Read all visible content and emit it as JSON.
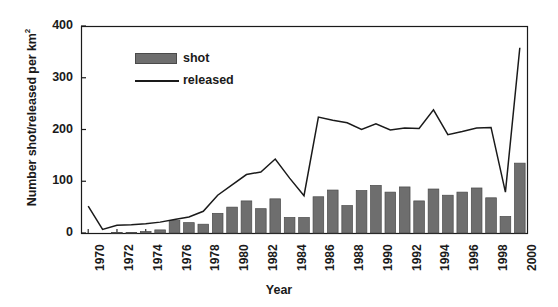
{
  "chart_data": {
    "type": "bar",
    "title": "",
    "xlabel": "Year",
    "ylabel": "Number shot/released per km²",
    "ylabel_text": "Number shot/released per km",
    "ylabel_sup": "2",
    "ylim": [
      0,
      400
    ],
    "yticks": [
      0,
      100,
      200,
      300,
      400
    ],
    "xlim": [
      1970,
      2000
    ],
    "xticks": [
      1970,
      1972,
      1974,
      1976,
      1978,
      1980,
      1982,
      1984,
      1986,
      1988,
      1990,
      1992,
      1994,
      1996,
      1998,
      2000
    ],
    "grid": false,
    "legend_position": "top-left-inside",
    "categories": [
      1970,
      1971,
      1972,
      1973,
      1974,
      1975,
      1976,
      1977,
      1978,
      1979,
      1980,
      1981,
      1982,
      1983,
      1984,
      1985,
      1986,
      1987,
      1988,
      1989,
      1990,
      1991,
      1992,
      1993,
      1994,
      1995,
      1996,
      1997,
      1998,
      1999,
      2000
    ],
    "series": [
      {
        "name": "shot",
        "type": "bar",
        "color": "#6e6e6e",
        "edge_color": "#4a4a4a",
        "values": [
          0,
          0,
          1,
          1,
          3,
          6,
          24,
          20,
          17,
          38,
          50,
          62,
          47,
          66,
          30,
          30,
          70,
          83,
          53,
          82,
          92,
          79,
          89,
          62,
          85,
          73,
          79,
          87,
          68,
          32,
          135
        ]
      },
      {
        "name": "released",
        "type": "line",
        "color": "#1a1a1a",
        "values": [
          52,
          7,
          15,
          16,
          18,
          21,
          26,
          31,
          42,
          73,
          93,
          113,
          118,
          143,
          106,
          72,
          224,
          218,
          213,
          200,
          211,
          199,
          203,
          202,
          238,
          190,
          196,
          203,
          204,
          79,
          358
        ]
      }
    ],
    "legend_entries": [
      {
        "label": "shot",
        "marker": "bar-swatch"
      },
      {
        "label": "released",
        "marker": "line-swatch"
      }
    ]
  },
  "axis_frame": {
    "left_px": 81,
    "right_px": 527,
    "top_px": 26,
    "bottom_px": 233
  }
}
